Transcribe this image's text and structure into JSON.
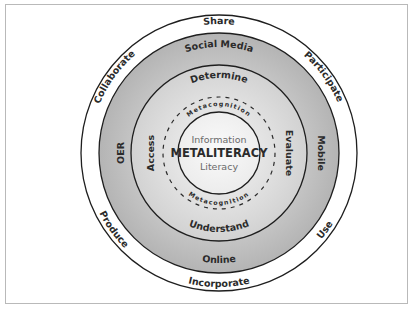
{
  "diagram": {
    "colors": {
      "frame_border": "#b9b9b9",
      "outer_ring": "#ffffff",
      "media_ring": "#bdbdbd",
      "action_ring": "#dcdcdc",
      "core_circle": "#f4f4f4",
      "stroke": "#1e1e1e",
      "text": "#2b2b2b",
      "core_light_text": "#6a6a6a"
    },
    "outer_ring": {
      "labels": {
        "top": "Share",
        "bottom": "Incorporate",
        "upper_left": "Collaborate",
        "upper_right": "Participate",
        "lower_left": "Produce",
        "lower_right": "Use"
      }
    },
    "media_ring": {
      "labels": {
        "top": "Social Media",
        "bottom": "Online",
        "left": "OER",
        "right": "Mobile"
      }
    },
    "action_ring": {
      "labels": {
        "top": "Determine",
        "bottom": "Understand",
        "left": "Access",
        "right": "Evaluate"
      }
    },
    "metacognition_ring": {
      "top": "Metacognition",
      "bottom": "Metacognition"
    },
    "core": {
      "line1": "Information",
      "line2": "METALITERACY",
      "line3": "Literacy"
    }
  }
}
